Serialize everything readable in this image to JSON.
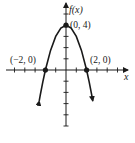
{
  "chart_data": {
    "type": "line",
    "title": "",
    "function": "f(x) = -x^2 + 4",
    "xlabel": "x",
    "ylabel": "f(x)",
    "xlim": [
      -5.5,
      6
    ],
    "ylim": [
      -5.8,
      5.8
    ],
    "grid": false,
    "legend": "none",
    "x": [
      -2.6,
      -2.5,
      -2.25,
      -2,
      -1.5,
      -1,
      -0.5,
      0,
      0.5,
      1,
      1.5,
      2,
      2.25,
      2.5,
      2.6
    ],
    "y": [
      -2.76,
      -2.25,
      -1.0625,
      0,
      1.75,
      3,
      3.75,
      4,
      3.75,
      3,
      1.75,
      0,
      -1.0625,
      -2.25,
      -2.76
    ],
    "points": [
      {
        "label": "(−2, 0)",
        "x": -2,
        "y": 0
      },
      {
        "label": "(0, 4)",
        "x": 0,
        "y": 4
      },
      {
        "label": "(2, 0)",
        "x": 2,
        "y": 0
      }
    ],
    "x_ticks": [
      -5,
      -4,
      -3,
      -2,
      -1,
      1,
      2,
      3,
      4,
      5
    ],
    "y_ticks": [
      -5,
      -4,
      -3,
      -2,
      -1,
      1,
      2,
      3,
      4,
      5
    ]
  },
  "labels": {
    "y_axis": "f(x)",
    "x_axis": "x",
    "vertex": "(0, 4)",
    "left_root": "(−2, 0)",
    "right_root": "(2, 0)"
  }
}
